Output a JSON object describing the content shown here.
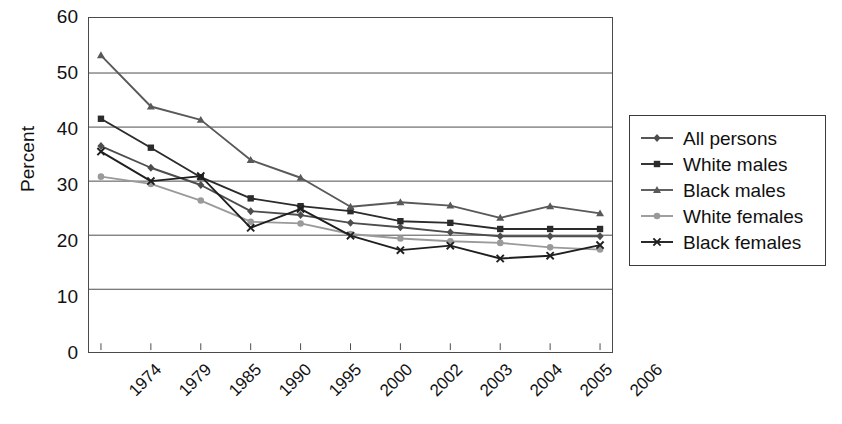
{
  "chart_data": {
    "type": "line",
    "title": "",
    "xlabel": "",
    "ylabel": "Percent",
    "ylim": [
      0,
      60
    ],
    "ytick_step": 10,
    "yticks": [
      60,
      50,
      40,
      30,
      20,
      10,
      0
    ],
    "grid": true,
    "legend_position": "right",
    "categories": [
      "1974",
      "1979",
      "1985",
      "1990",
      "1995",
      "2000",
      "2002",
      "2003",
      "2004",
      "2005",
      "2006"
    ],
    "series": [
      {
        "name": "All persons",
        "marker": "diamond",
        "color": "#4d4d4d",
        "values": [
          37.0,
          33.1,
          30.0,
          25.3,
          24.6,
          23.2,
          22.4,
          21.5,
          20.8,
          20.8,
          20.8
        ]
      },
      {
        "name": "White males",
        "marker": "square",
        "color": "#2b2b2b",
        "values": [
          41.9,
          36.7,
          31.4,
          27.6,
          26.2,
          25.3,
          23.5,
          23.2,
          22.1,
          22.1,
          22.1
        ]
      },
      {
        "name": "Black males",
        "marker": "triangle",
        "color": "#595959",
        "values": [
          53.3,
          44.1,
          41.7,
          34.5,
          31.3,
          26.1,
          26.9,
          26.3,
          24.1,
          26.2,
          24.9
        ]
      },
      {
        "name": "White females",
        "marker": "circle",
        "color": "#9a9a9a",
        "values": [
          31.5,
          30.2,
          27.2,
          23.4,
          23.1,
          21.2,
          20.4,
          19.9,
          19.6,
          18.8,
          18.4
        ]
      },
      {
        "name": "Black females",
        "marker": "x",
        "color": "#1f1f1f",
        "values": [
          36.0,
          30.7,
          31.6,
          22.3,
          25.7,
          20.9,
          18.3,
          19.1,
          16.8,
          17.3,
          19.2
        ]
      }
    ]
  },
  "legend": {
    "items": [
      {
        "label": "All persons"
      },
      {
        "label": "White males"
      },
      {
        "label": "Black males"
      },
      {
        "label": "White females"
      },
      {
        "label": "Black females"
      }
    ]
  }
}
